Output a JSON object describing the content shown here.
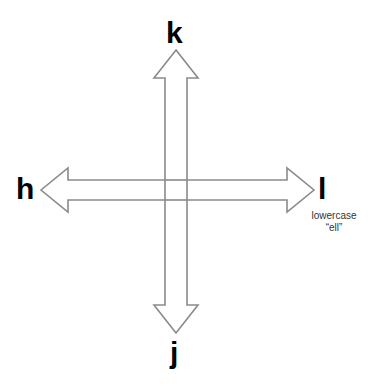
{
  "diagram": {
    "keys": {
      "up": {
        "label": "k",
        "direction": "up"
      },
      "down": {
        "label": "j",
        "direction": "down"
      },
      "left": {
        "label": "h",
        "direction": "left"
      },
      "right": {
        "label": "l",
        "direction": "right"
      }
    },
    "notes": {
      "right_line1": "lowercase",
      "right_line2": "“ell”"
    },
    "colors": {
      "arrow_stroke": "#8a8a8a",
      "arrow_fill": "#ffffff",
      "label": "#000000"
    }
  }
}
